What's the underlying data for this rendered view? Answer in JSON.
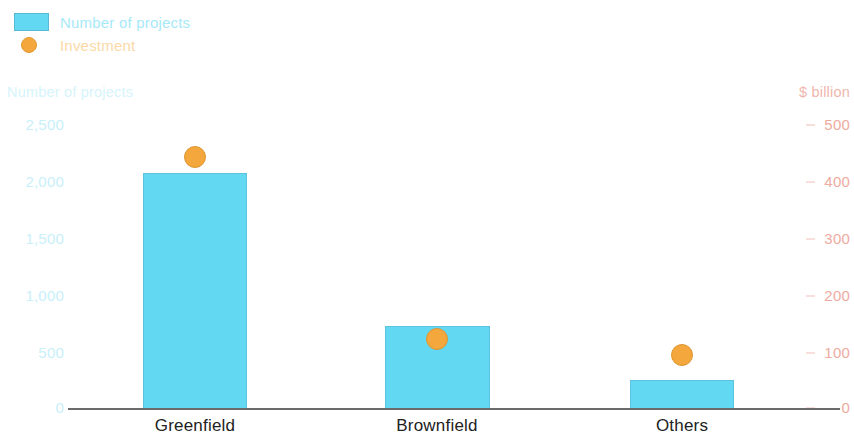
{
  "legend": {
    "items": [
      {
        "label": "Number of projects",
        "marker": "bar-swatch-icon",
        "color": "#62d8f2"
      },
      {
        "label": "Investment",
        "marker": "circle-marker-icon",
        "color": "#f4a73d"
      }
    ]
  },
  "axes": {
    "left_title": "Number of projects",
    "right_title": "$ billion",
    "left_ticks": [
      "2,500",
      "2,000",
      "1,500",
      "1,000",
      "500",
      "0"
    ],
    "right_ticks": [
      "500",
      "400",
      "300",
      "200",
      "100",
      "0"
    ]
  },
  "categories": [
    "Greenfield",
    "Brownfield",
    "Others"
  ],
  "chart_data": {
    "type": "bar",
    "title": "",
    "subtitle": "",
    "xlabel": "",
    "ylabel": "Number of projects",
    "y2label": "$ billion",
    "categories": [
      "Greenfield",
      "Brownfield",
      "Others"
    ],
    "series": [
      {
        "name": "Number of projects",
        "type": "bar",
        "axis": "left",
        "color": "#62d8f2",
        "values": [
          2070,
          720,
          245
        ]
      },
      {
        "name": "Investment",
        "type": "scatter",
        "axis": "right",
        "color": "#f4a73d",
        "values": [
          442,
          121,
          93
        ]
      }
    ],
    "ylim": [
      0,
      2500
    ],
    "y2lim": [
      0,
      500
    ],
    "yticks": [
      0,
      500,
      1000,
      1500,
      2000,
      2500
    ],
    "y2ticks": [
      0,
      100,
      200,
      300,
      400,
      500
    ],
    "grid": false,
    "legend_position": "top-left"
  }
}
